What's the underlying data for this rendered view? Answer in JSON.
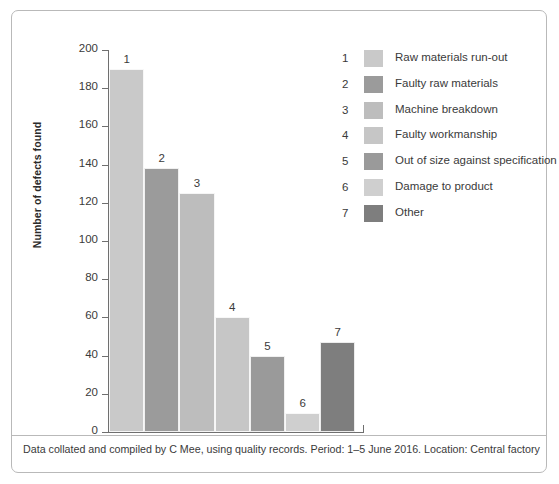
{
  "chart_data": {
    "type": "bar",
    "title": "",
    "xlabel": "",
    "ylabel": "Number of defects found",
    "ylim": [
      0,
      200
    ],
    "ytick_step": 20,
    "yticks": [
      0,
      20,
      40,
      60,
      80,
      100,
      120,
      140,
      160,
      180,
      200
    ],
    "grid": false,
    "legend_position": "right",
    "categories": [
      "1",
      "2",
      "3",
      "4",
      "5",
      "6",
      "7"
    ],
    "values": [
      190,
      138,
      125,
      60,
      40,
      10,
      47
    ],
    "bar_labels": [
      "1",
      "2",
      "3",
      "4",
      "5",
      "6",
      "7"
    ],
    "colors": [
      "#c9c9c9",
      "#9b9b9b",
      "#bdbdbd",
      "#c6c6c6",
      "#9a9a9a",
      "#cfcfcf",
      "#7e7e7e"
    ],
    "legend": [
      {
        "num": "1",
        "label": "Raw materials run-out",
        "color": "#c9c9c9"
      },
      {
        "num": "2",
        "label": "Faulty raw materials",
        "color": "#9b9b9b"
      },
      {
        "num": "3",
        "label": "Machine breakdown",
        "color": "#bdbdbd"
      },
      {
        "num": "4",
        "label": "Faulty workmanship",
        "color": "#c6c6c6"
      },
      {
        "num": "5",
        "label": "Out of size against specification",
        "color": "#9a9a9a"
      },
      {
        "num": "6",
        "label": "Damage to product",
        "color": "#cfcfcf"
      },
      {
        "num": "7",
        "label": "Other",
        "color": "#7e7e7e"
      }
    ],
    "caption": "Data collated and compiled by C Mee, using quality records. Period: 1–5 June 2016. Location: Central factory"
  }
}
